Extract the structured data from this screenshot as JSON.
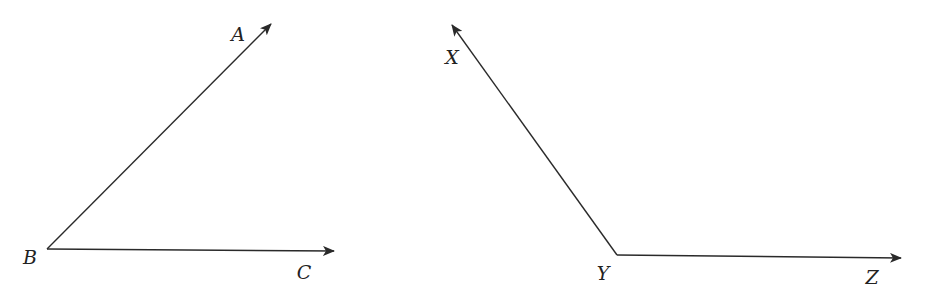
{
  "diagram": {
    "type": "geometry-angles",
    "stroke_color": "#2a2a2a",
    "label_color": "#222222",
    "background": "#ffffff",
    "angles": [
      {
        "name": "angle-ABC",
        "vertex": {
          "label": "B",
          "x": 47,
          "y": 249,
          "label_x": 30,
          "label_y": 257
        },
        "rays": [
          {
            "label": "A",
            "tip_x": 271,
            "tip_y": 24,
            "label_x": 238,
            "label_y": 34
          },
          {
            "label": "C",
            "tip_x": 334,
            "tip_y": 251,
            "label_x": 304,
            "label_y": 272
          }
        ]
      },
      {
        "name": "angle-XYZ",
        "vertex": {
          "label": "Y",
          "x": 617,
          "y": 255,
          "label_x": 603,
          "label_y": 273
        },
        "rays": [
          {
            "label": "X",
            "tip_x": 452,
            "tip_y": 25,
            "label_x": 452,
            "label_y": 57
          },
          {
            "label": "Z",
            "tip_x": 901,
            "tip_y": 258,
            "label_x": 872,
            "label_y": 277
          }
        ]
      }
    ]
  },
  "labels": {
    "A": "A",
    "B": "B",
    "C": "C",
    "X": "X",
    "Y": "Y",
    "Z": "Z"
  }
}
